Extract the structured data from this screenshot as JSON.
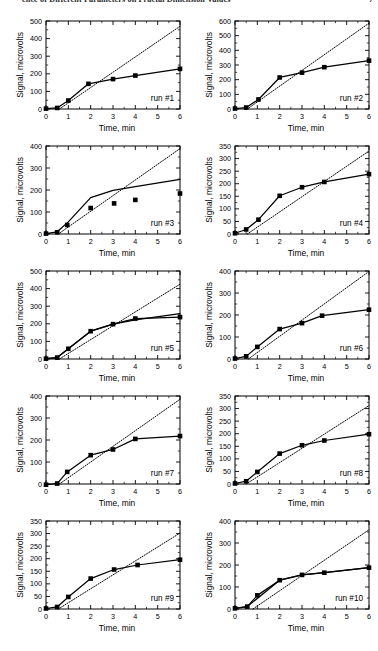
{
  "running_head": {
    "text": "ence of Different Parameters on Fractal Dimension Values",
    "page_number": "7"
  },
  "axes": {
    "xlabel": "Time, min",
    "ylabel": "Signal, microvolts",
    "xlim": [
      0,
      6
    ],
    "xticks": [
      0,
      1,
      2,
      3,
      4,
      5,
      6
    ],
    "xtick_labels": [
      "0",
      "1",
      "2",
      "3",
      "4",
      "5",
      "6"
    ]
  },
  "chart_data": [
    {
      "type": "scatter",
      "title": "run #1",
      "xlabel": "Time, min",
      "ylabel": "Signal, microvolts",
      "xlim": [
        0,
        6
      ],
      "ylim": [
        0,
        500
      ],
      "yticks": [
        0,
        100,
        200,
        300,
        400,
        500
      ],
      "ytick_labels": [
        "0",
        "100",
        "200",
        "300",
        "400",
        "500"
      ],
      "grid": false,
      "legend": "none",
      "series": [
        {
          "name": "measured signal",
          "style": "solid-line-with-square-markers",
          "x": [
            0,
            0.5,
            1.0,
            1.9,
            3.0,
            4.0,
            6.0
          ],
          "values": [
            2,
            6,
            48,
            143,
            170,
            190,
            228
          ]
        },
        {
          "name": "linear reference",
          "style": "dotted-line",
          "x": [
            0.6,
            6.0
          ],
          "values": [
            0,
            470
          ]
        }
      ]
    },
    {
      "type": "scatter",
      "title": "run #2",
      "xlabel": "Time, min",
      "ylabel": "Signal, microvolts",
      "xlim": [
        0,
        6
      ],
      "ylim": [
        0,
        600
      ],
      "yticks": [
        0,
        100,
        200,
        300,
        400,
        500,
        600
      ],
      "ytick_labels": [
        "0",
        "100",
        "200",
        "300",
        "400",
        "500",
        "600"
      ],
      "grid": false,
      "legend": "none",
      "series": [
        {
          "name": "measured signal",
          "style": "solid-line-with-square-markers",
          "x": [
            0,
            0.5,
            1.05,
            2.0,
            3.0,
            4.0,
            6.0
          ],
          "values": [
            3,
            10,
            65,
            215,
            248,
            285,
            330
          ]
        },
        {
          "name": "linear reference",
          "style": "dotted-line",
          "x": [
            0.55,
            6.0
          ],
          "values": [
            0,
            585
          ]
        }
      ]
    },
    {
      "type": "scatter",
      "title": "run #3",
      "xlabel": "Time, min",
      "ylabel": "Signal, microvolts",
      "xlim": [
        0,
        6
      ],
      "ylim": [
        0,
        400
      ],
      "yticks": [
        0,
        100,
        200,
        300,
        400
      ],
      "ytick_labels": [
        "0",
        "100",
        "200",
        "300",
        "400"
      ],
      "grid": false,
      "legend": "none",
      "series": [
        {
          "name": "measured signal",
          "style": "square-markers",
          "x": [
            0,
            0.5,
            0.95,
            2.0,
            3.05,
            4.0,
            6.0
          ],
          "values": [
            2,
            8,
            41,
            118,
            139,
            155,
            184
          ]
        },
        {
          "name": "fitted curve",
          "style": "solid-line",
          "x": [
            0,
            0.5,
            1.0,
            2.0,
            3.0,
            4.0,
            6.0
          ],
          "values": [
            2,
            10,
            55,
            165,
            198,
            215,
            248
          ]
        },
        {
          "name": "linear reference",
          "style": "dotted-line",
          "x": [
            0.55,
            6.0
          ],
          "values": [
            0,
            388
          ]
        }
      ]
    },
    {
      "type": "scatter",
      "title": "run #4",
      "xlabel": "Time, min",
      "ylabel": "Signal, microvolts",
      "xlim": [
        0,
        6
      ],
      "ylim": [
        0,
        350
      ],
      "yticks": [
        0,
        50,
        100,
        150,
        200,
        250,
        300,
        350
      ],
      "ytick_labels": [
        "0",
        "50",
        "100",
        "150",
        "200",
        "250",
        "300",
        "350"
      ],
      "grid": false,
      "legend": "none",
      "series": [
        {
          "name": "measured signal",
          "style": "solid-line-with-square-markers",
          "x": [
            0,
            0.5,
            1.05,
            2.0,
            3.0,
            4.0,
            6.0
          ],
          "values": [
            3,
            18,
            57,
            152,
            186,
            207,
            238
          ]
        },
        {
          "name": "linear reference",
          "style": "dotted-line",
          "x": [
            0.55,
            6.0
          ],
          "values": [
            0,
            330
          ]
        }
      ]
    },
    {
      "type": "scatter",
      "title": "run #5",
      "xlabel": "Time, min",
      "ylabel": "Signal, microvolts",
      "xlim": [
        0,
        6
      ],
      "ylim": [
        0,
        500
      ],
      "yticks": [
        0,
        100,
        200,
        300,
        400,
        500
      ],
      "ytick_labels": [
        "0",
        "100",
        "200",
        "300",
        "400",
        "500"
      ],
      "grid": false,
      "legend": "none",
      "series": [
        {
          "name": "measured signal",
          "style": "solid-line-with-square-markers",
          "x": [
            0,
            0.5,
            1.0,
            2.0,
            3.0,
            4.0,
            6.0
          ],
          "values": [
            2,
            8,
            58,
            158,
            198,
            230,
            238
          ]
        },
        {
          "name": "fitted curve",
          "style": "solid-line",
          "x": [
            0,
            0.5,
            1.0,
            2.0,
            3.0,
            4.0,
            6.0
          ],
          "values": [
            2,
            8,
            58,
            158,
            198,
            222,
            258
          ]
        },
        {
          "name": "linear reference",
          "style": "dotted-line",
          "x": [
            0.6,
            6.0
          ],
          "values": [
            0,
            425
          ]
        }
      ]
    },
    {
      "type": "scatter",
      "title": "run #6",
      "xlabel": "Time, min",
      "ylabel": "Signal, microvolts",
      "xlim": [
        0,
        6
      ],
      "ylim": [
        0,
        400
      ],
      "yticks": [
        0,
        100,
        200,
        300,
        400
      ],
      "ytick_labels": [
        "0",
        "100",
        "200",
        "300",
        "400"
      ],
      "grid": false,
      "legend": "none",
      "series": [
        {
          "name": "measured signal",
          "style": "solid-line-with-square-markers",
          "x": [
            0,
            0.5,
            1.0,
            2.0,
            3.0,
            3.9,
            6.0
          ],
          "values": [
            2,
            12,
            55,
            136,
            163,
            197,
            224
          ]
        },
        {
          "name": "linear reference",
          "style": "dotted-line",
          "x": [
            0.6,
            6.0
          ],
          "values": [
            0,
            398
          ]
        }
      ]
    },
    {
      "type": "scatter",
      "title": "run #7",
      "xlabel": "Time, min",
      "ylabel": "Signal, microvolts",
      "xlim": [
        0,
        6
      ],
      "ylim": [
        0,
        400
      ],
      "yticks": [
        0,
        100,
        200,
        300,
        400
      ],
      "ytick_labels": [
        "0",
        "100",
        "200",
        "300",
        "400"
      ],
      "grid": false,
      "legend": "none",
      "series": [
        {
          "name": "measured signal",
          "style": "solid-line-with-square-markers",
          "x": [
            0,
            0.5,
            0.95,
            2.0,
            3.0,
            4.0,
            6.0
          ],
          "values": [
            -3,
            2,
            55,
            131,
            157,
            205,
            218
          ]
        },
        {
          "name": "linear reference",
          "style": "dotted-line",
          "x": [
            0.6,
            6.0
          ],
          "values": [
            0,
            385
          ]
        }
      ]
    },
    {
      "type": "scatter",
      "title": "run #8",
      "xlabel": "Time, min",
      "ylabel": "Signal, microvolts",
      "xlim": [
        0,
        6
      ],
      "ylim": [
        0,
        350
      ],
      "yticks": [
        0,
        50,
        100,
        150,
        200,
        250,
        300,
        350
      ],
      "ytick_labels": [
        "0",
        "50",
        "100",
        "150",
        "200",
        "250",
        "300",
        "350"
      ],
      "grid": false,
      "legend": "none",
      "series": [
        {
          "name": "measured signal",
          "style": "solid-line-with-square-markers",
          "x": [
            0,
            0.5,
            1.0,
            2.0,
            3.0,
            4.0,
            6.0
          ],
          "values": [
            2,
            11,
            48,
            121,
            154,
            173,
            198
          ]
        },
        {
          "name": "linear reference",
          "style": "dotted-line",
          "x": [
            0.5,
            6.0
          ],
          "values": [
            0,
            312
          ]
        }
      ]
    },
    {
      "type": "scatter",
      "title": "run #9",
      "xlabel": "Time, min",
      "ylabel": "Signal, microvolts",
      "xlim": [
        0,
        6
      ],
      "ylim": [
        0,
        350
      ],
      "yticks": [
        0,
        50,
        100,
        150,
        200,
        250,
        300,
        350
      ],
      "ytick_labels": [
        "0",
        "50",
        "100",
        "150",
        "200",
        "250",
        "300",
        "350"
      ],
      "grid": false,
      "legend": "none",
      "series": [
        {
          "name": "measured signal",
          "style": "solid-line-with-square-markers",
          "x": [
            0,
            0.5,
            1.0,
            2.0,
            3.05,
            4.1,
            6.0
          ],
          "values": [
            2,
            8,
            48,
            121,
            157,
            175,
            196
          ]
        },
        {
          "name": "linear reference",
          "style": "dotted-line",
          "x": [
            0.55,
            6.0
          ],
          "values": [
            0,
            302
          ]
        }
      ]
    },
    {
      "type": "scatter",
      "title": "run #10",
      "xlabel": "Time, min",
      "ylabel": "Signal, microvolts",
      "xlim": [
        0,
        6
      ],
      "ylim": [
        0,
        400
      ],
      "yticks": [
        0,
        100,
        200,
        300,
        400
      ],
      "ytick_labels": [
        "0",
        "100",
        "200",
        "300",
        "400"
      ],
      "grid": false,
      "legend": "none",
      "series": [
        {
          "name": "measured signal",
          "style": "solid-line-with-square-markers",
          "x": [
            0,
            0.55,
            1.0,
            2.0,
            3.0,
            4.0,
            6.0
          ],
          "values": [
            3,
            11,
            62,
            131,
            155,
            165,
            188
          ]
        },
        {
          "name": "fitted curve",
          "style": "solid-line",
          "x": [
            0,
            0.55,
            2.0,
            3.0,
            4.0,
            6.0
          ],
          "values": [
            3,
            11,
            131,
            155,
            165,
            188
          ]
        },
        {
          "name": "linear reference",
          "style": "dotted-line",
          "x": [
            0.8,
            6.0
          ],
          "values": [
            0,
            360
          ]
        }
      ]
    }
  ]
}
